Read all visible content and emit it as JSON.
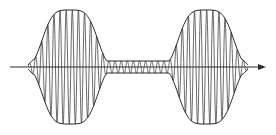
{
  "diagram": {
    "type": "amplitude-modulated-wave",
    "colors": {
      "background": "#ffffff",
      "stroke": "#2a2a2a",
      "carrier": "#444444"
    },
    "axis": {
      "x_start": 10,
      "x_end": 266,
      "y": 67,
      "arrow": true
    },
    "envelope": {
      "x_start": 28,
      "x_end": 248,
      "center_y": 67,
      "lobes": [
        {
          "center_x": 70,
          "half_height": 57
        },
        {
          "center_x": 206,
          "half_height": 57
        }
      ],
      "waist": {
        "center_x": 138,
        "half_height": 6
      }
    },
    "carrier": {
      "cycles": 36
    }
  }
}
